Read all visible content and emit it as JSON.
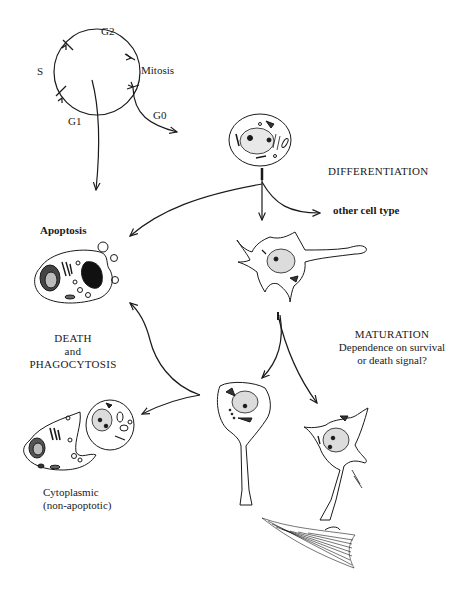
{
  "diagram": {
    "cell_cycle": {
      "phases": {
        "g2": "G2",
        "s": "S",
        "mitosis": "Mitosis",
        "g1": "G1",
        "g0": "G0"
      }
    },
    "labels": {
      "differentiation": "DIFFERENTIATION",
      "other_cell_type": "other cell type",
      "apoptosis": "Apoptosis",
      "death_line1": "DEATH",
      "death_line2": "and",
      "death_line3": "PHAGOCYTOSIS",
      "maturation_line1": "MATURATION",
      "maturation_line2": "Dependence on survival",
      "maturation_line3": "or death signal?",
      "cytoplasmic_line1": "Cytoplasmic",
      "cytoplasmic_line2": "(non-apoptotic)"
    },
    "colors": {
      "ink": "#1a1a1a",
      "background": "#ffffff"
    }
  }
}
